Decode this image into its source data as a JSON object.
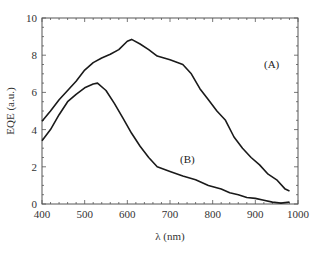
{
  "chart_data": {
    "type": "line",
    "title": "",
    "xlabel": "λ (nm)",
    "ylabel": "EQE (a.u.)",
    "xlim": [
      400,
      1000
    ],
    "ylim": [
      0,
      10
    ],
    "xticks": [
      400,
      500,
      600,
      700,
      800,
      900,
      1000
    ],
    "yticks": [
      0,
      2,
      4,
      6,
      8,
      10
    ],
    "grid": false,
    "legend": "inline labels",
    "series": [
      {
        "name": "(A)",
        "x": [
          400,
          420,
          440,
          460,
          480,
          500,
          520,
          540,
          560,
          580,
          600,
          610,
          630,
          650,
          670,
          700,
          730,
          750,
          770,
          790,
          810,
          830,
          850,
          870,
          890,
          910,
          930,
          950,
          970,
          980
        ],
        "values": [
          4.45,
          5.0,
          5.6,
          6.1,
          6.6,
          7.2,
          7.6,
          7.85,
          8.05,
          8.3,
          8.75,
          8.85,
          8.6,
          8.3,
          7.95,
          7.75,
          7.5,
          7.0,
          6.2,
          5.6,
          5.0,
          4.5,
          3.6,
          3.0,
          2.5,
          2.1,
          1.6,
          1.3,
          0.8,
          0.7
        ]
      },
      {
        "name": "(B)",
        "x": [
          400,
          420,
          440,
          460,
          480,
          500,
          520,
          530,
          550,
          570,
          590,
          610,
          630,
          650,
          670,
          700,
          730,
          760,
          790,
          820,
          840,
          860,
          880,
          900,
          920,
          940,
          960,
          980
        ],
        "values": [
          3.4,
          4.0,
          4.8,
          5.5,
          5.9,
          6.25,
          6.45,
          6.5,
          6.1,
          5.4,
          4.6,
          3.8,
          3.1,
          2.5,
          2.0,
          1.75,
          1.5,
          1.3,
          1.0,
          0.8,
          0.6,
          0.5,
          0.35,
          0.3,
          0.2,
          0.1,
          0.05,
          0.1
        ]
      }
    ],
    "annotations": [
      {
        "text": "(A)",
        "x": 745,
        "y": 7.5
      },
      {
        "text": "(B)",
        "x": 700,
        "y": 3.9
      }
    ]
  },
  "labels": {
    "xlabel": "λ (nm)",
    "ylabel": "EQE (a.u.)",
    "series_a": "(A)",
    "series_b": "(B)"
  }
}
